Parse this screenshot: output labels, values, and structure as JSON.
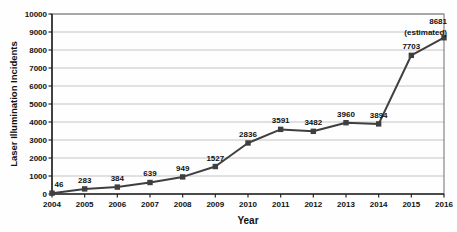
{
  "chart_data": {
    "type": "line",
    "title": "",
    "xlabel": "Year",
    "ylabel": "Laser Illumination Incidents",
    "x": [
      2004,
      2005,
      2006,
      2007,
      2008,
      2009,
      2010,
      2011,
      2012,
      2013,
      2014,
      2015,
      2016
    ],
    "series": [
      {
        "name": "Laser illumination incidents",
        "values": [
          46,
          283,
          384,
          639,
          949,
          1527,
          2836,
          3591,
          3482,
          3960,
          3894,
          7703,
          8681
        ]
      }
    ],
    "point_labels": [
      "46",
      "283",
      "384",
      "639",
      "949",
      "1527",
      "2836",
      "3591",
      "3482",
      "3960",
      "3894",
      "7703",
      "8681\n(estimated)"
    ],
    "last_point_note": "(estimated)",
    "ylim": [
      0,
      10000
    ],
    "yticks": [
      0,
      1000,
      2000,
      3000,
      4000,
      5000,
      6000,
      7000,
      8000,
      9000,
      10000
    ],
    "grid": "horizontal",
    "legend": "none",
    "colors": {
      "line": "#3f3f3f",
      "marker": "#3f3f3f",
      "gridline": "#c4c4c4",
      "plot_border": "#6e6e6e",
      "axis_line": "#262626",
      "text": "#111111",
      "background": "#ffffff"
    },
    "marker_shape": "square"
  }
}
